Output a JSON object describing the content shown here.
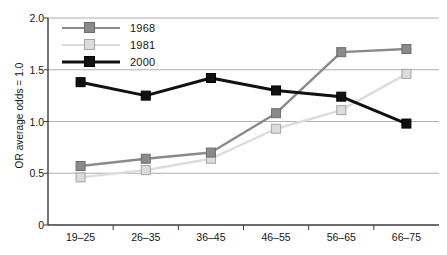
{
  "chart_data": {
    "type": "line",
    "title": "",
    "xlabel": "",
    "ylabel": "OR average odds = 1.0",
    "categories": [
      "19–25",
      "26–35",
      "36–45",
      "46–55",
      "56–65",
      "66–75"
    ],
    "series": [
      {
        "name": "1968",
        "color": "#8a8a8a",
        "values": [
          0.57,
          0.64,
          0.7,
          1.08,
          1.67,
          1.7
        ]
      },
      {
        "name": "1981",
        "color": "#dcdcdc",
        "values": [
          0.46,
          0.53,
          0.64,
          0.93,
          1.11,
          1.46
        ]
      },
      {
        "name": "2000",
        "color": "#111111",
        "values": [
          1.38,
          1.25,
          1.42,
          1.3,
          1.24,
          0.98
        ]
      }
    ],
    "ylim": [
      0,
      2.0
    ],
    "yticks": [
      0,
      0.5,
      1.0,
      1.5,
      2.0
    ],
    "ytick_labels": [
      "0",
      "0.5",
      "1.0",
      "1.5",
      "2.0"
    ],
    "grid": true,
    "grid_color": "#9a9a9a",
    "legend_position": "top-left",
    "legend_entries": [
      "1968",
      "1981",
      "2000"
    ]
  },
  "axis": {
    "line_color": "#3c3c3c"
  }
}
